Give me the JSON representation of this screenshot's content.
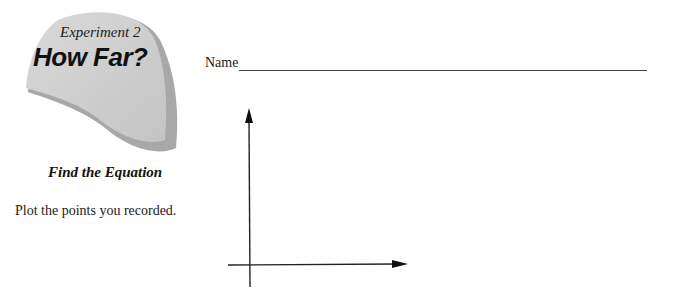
{
  "header": {
    "experiment_label": "Experiment 2",
    "title": "How Far?",
    "subtitle": "Find the Equation"
  },
  "instructions": {
    "text": "Plot the points you recorded."
  },
  "name_field": {
    "label": "Name",
    "value": ""
  },
  "graph": {
    "type": "blank-axes",
    "x_axis_label": "",
    "y_axis_label": "",
    "points": []
  },
  "colors": {
    "blob_fill": "#cfcfcf",
    "blob_shadow": "#a9a9a9",
    "ink": "#1a1a1a"
  }
}
